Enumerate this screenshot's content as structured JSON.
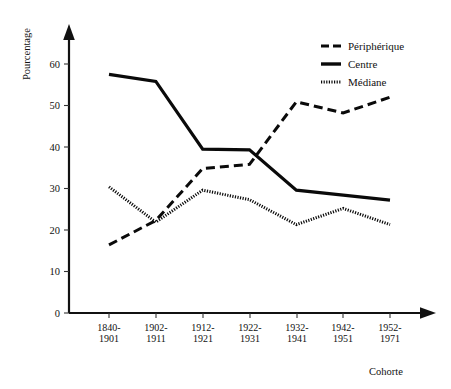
{
  "chart_data": {
    "type": "line",
    "title": "",
    "xlabel": "Cohorte",
    "ylabel": "Pourcentage",
    "categories": [
      "1840-1901",
      "1902-1911",
      "1912-1921",
      "1922-1931",
      "1932-1941",
      "1942-1951",
      "1952-1971"
    ],
    "category_lines": [
      [
        "1840-",
        "1901"
      ],
      [
        "1902-",
        "1911"
      ],
      [
        "1912-",
        "1921"
      ],
      [
        "1922-",
        "1931"
      ],
      [
        "1932-",
        "1941"
      ],
      [
        "1942-",
        "1951"
      ],
      [
        "1952-",
        "1971"
      ]
    ],
    "ylim": [
      0,
      65
    ],
    "yticks": [
      0,
      10,
      20,
      30,
      40,
      50,
      60
    ],
    "ytick_labels": [
      "0",
      "10",
      "20",
      "30",
      "40",
      "50",
      "60"
    ],
    "grid": false,
    "legend_position": "top-right",
    "series": [
      {
        "name": "Périphérique",
        "style": "dash-dot",
        "color": "#0a0a0a",
        "values": [
          16.4,
          22.3,
          34.8,
          35.8,
          50.9,
          48.2,
          52.0
        ]
      },
      {
        "name": "Centre",
        "style": "solid",
        "color": "#0a0a0a",
        "values": [
          57.5,
          55.8,
          39.5,
          39.3,
          29.6,
          28.4,
          27.2
        ]
      },
      {
        "name": "Médiane",
        "style": "dotted",
        "color": "#0a0a0a",
        "values": [
          30.4,
          21.9,
          29.6,
          27.3,
          21.3,
          25.2,
          21.3
        ]
      }
    ]
  },
  "legend": {
    "items": [
      {
        "label": "Périphérique",
        "style": "dash-dot"
      },
      {
        "label": "Centre",
        "style": "solid"
      },
      {
        "label": "Médiane",
        "style": "dotted"
      }
    ]
  },
  "axes": {
    "y_title": "Pourcentage",
    "x_title": "Cohorte"
  }
}
